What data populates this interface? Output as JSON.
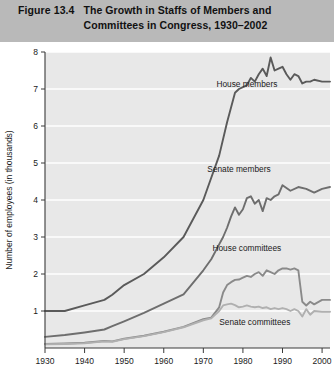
{
  "header": {
    "figure_number": "Figure 13.4",
    "title_line1": "The Growth in Staffs of Members and",
    "title_line2": "Committees in Congress, 1930–2002",
    "band_color": "#b9b9b9"
  },
  "chart_data": {
    "type": "line",
    "title": "The Growth in Staffs of Members and Committees in Congress, 1930–2002",
    "xlabel": "",
    "ylabel": "Number of employees (in thousands)",
    "xlim": [
      1930,
      2002
    ],
    "ylim": [
      0,
      8
    ],
    "xticks": [
      "1930",
      "1940",
      "1950",
      "1960",
      "1970",
      "1980",
      "1990",
      "2000"
    ],
    "xtick_values": [
      1930,
      1940,
      1950,
      1960,
      1970,
      1980,
      1990,
      2000
    ],
    "yticks": [
      "1",
      "2",
      "3",
      "4",
      "5",
      "6",
      "7",
      "8"
    ],
    "ytick_values": [
      1,
      2,
      3,
      4,
      5,
      6,
      7,
      8
    ],
    "grid": "horizontal-white",
    "plot_background": "#e8e8e8",
    "legend_position": "inline-annotations",
    "series": [
      {
        "name": "House members",
        "color": "#5a5a5a",
        "label_x": 1981,
        "label_y": 7.05,
        "x": [
          1930,
          1935,
          1940,
          1945,
          1947,
          1950,
          1955,
          1960,
          1965,
          1970,
          1972,
          1974,
          1976,
          1978,
          1979,
          1980,
          1981,
          1982,
          1983,
          1984,
          1985,
          1986,
          1987,
          1988,
          1989,
          1990,
          1991,
          1992,
          1993,
          1994,
          1995,
          1996,
          1997,
          1998,
          2000,
          2002
        ],
        "y": [
          1.0,
          1.0,
          1.15,
          1.3,
          1.44,
          1.7,
          2.0,
          2.45,
          3.0,
          4.0,
          4.6,
          5.2,
          6.1,
          6.9,
          7.0,
          7.05,
          7.1,
          7.3,
          7.2,
          7.4,
          7.55,
          7.35,
          7.85,
          7.5,
          7.55,
          7.6,
          7.4,
          7.25,
          7.4,
          7.35,
          7.15,
          7.2,
          7.2,
          7.25,
          7.2,
          7.2
        ]
      },
      {
        "name": "Senate members",
        "color": "#6e6e6e",
        "label_x": 1979,
        "label_y": 4.75,
        "x": [
          1930,
          1935,
          1940,
          1945,
          1947,
          1950,
          1955,
          1960,
          1965,
          1970,
          1972,
          1974,
          1975,
          1976,
          1977,
          1978,
          1979,
          1980,
          1981,
          1982,
          1983,
          1984,
          1985,
          1986,
          1987,
          1988,
          1989,
          1990,
          1992,
          1994,
          1996,
          1998,
          2000,
          2002
        ],
        "y": [
          0.3,
          0.35,
          0.42,
          0.5,
          0.59,
          0.72,
          0.95,
          1.2,
          1.45,
          2.1,
          2.4,
          2.8,
          3.0,
          3.25,
          3.55,
          3.8,
          3.6,
          3.75,
          4.05,
          4.1,
          3.9,
          4.0,
          3.7,
          4.05,
          4.0,
          4.1,
          4.15,
          4.4,
          4.25,
          4.35,
          4.3,
          4.2,
          4.3,
          4.35
        ]
      },
      {
        "name": "House committees",
        "color": "#8a8a8a",
        "label_x": 1981,
        "label_y": 2.62,
        "x": [
          1930,
          1935,
          1940,
          1945,
          1947,
          1950,
          1955,
          1960,
          1965,
          1970,
          1972,
          1974,
          1975,
          1976,
          1977,
          1978,
          1979,
          1980,
          1981,
          1982,
          1983,
          1984,
          1985,
          1986,
          1987,
          1988,
          1989,
          1990,
          1991,
          1992,
          1993,
          1994,
          1995,
          1996,
          1997,
          1998,
          2000,
          2002
        ],
        "y": [
          0.11,
          0.12,
          0.14,
          0.19,
          0.18,
          0.25,
          0.33,
          0.44,
          0.57,
          0.78,
          0.82,
          1.1,
          1.5,
          1.7,
          1.78,
          1.84,
          1.85,
          1.9,
          1.95,
          1.92,
          2.0,
          2.05,
          1.95,
          2.1,
          2.05,
          2.0,
          2.1,
          2.15,
          2.15,
          2.12,
          2.15,
          2.1,
          1.25,
          1.15,
          1.25,
          1.18,
          1.3,
          1.3
        ]
      },
      {
        "name": "Senate committees",
        "color": "#b0b0b0",
        "label_x": 1983,
        "label_y": 0.62,
        "x": [
          1930,
          1935,
          1940,
          1945,
          1947,
          1950,
          1955,
          1960,
          1965,
          1970,
          1972,
          1974,
          1975,
          1976,
          1977,
          1978,
          1979,
          1980,
          1981,
          1982,
          1983,
          1984,
          1985,
          1986,
          1987,
          1988,
          1989,
          1990,
          1991,
          1992,
          1993,
          1994,
          1995,
          1996,
          1997,
          1998,
          2000,
          2002
        ],
        "y": [
          0.1,
          0.11,
          0.13,
          0.18,
          0.17,
          0.24,
          0.32,
          0.43,
          0.56,
          0.75,
          0.8,
          1.0,
          1.15,
          1.18,
          1.2,
          1.16,
          1.1,
          1.12,
          1.15,
          1.12,
          1.1,
          1.12,
          1.08,
          1.1,
          1.05,
          1.08,
          1.05,
          1.08,
          1.05,
          1.0,
          1.05,
          1.0,
          0.85,
          1.05,
          0.9,
          1.0,
          0.98,
          0.98
        ]
      }
    ]
  }
}
